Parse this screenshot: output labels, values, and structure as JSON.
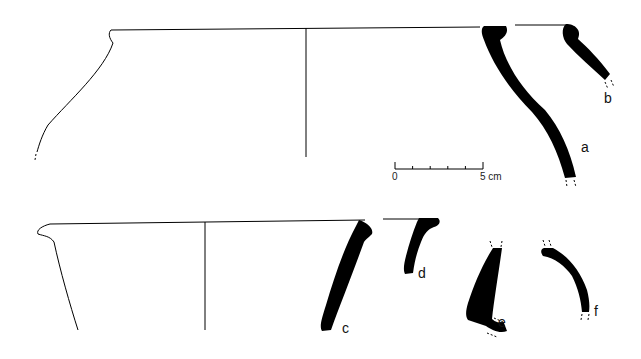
{
  "figure": {
    "type": "pottery profile drawings",
    "sherd_labels": [
      "a",
      "b",
      "c",
      "d",
      "e",
      "f"
    ],
    "scale_bar": {
      "start_label": "0",
      "end_label": "5 cm",
      "length_cm": 5,
      "divisions": 5
    },
    "colors": {
      "ink": "#000000",
      "background": "#ffffff"
    }
  }
}
